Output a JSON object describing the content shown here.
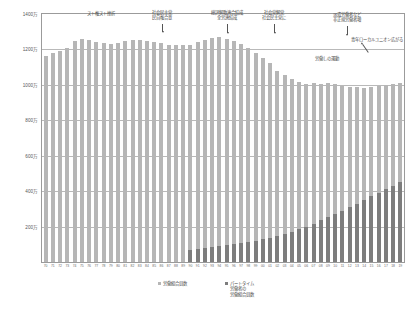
{
  "chart_data": {
    "type": "bar",
    "stacked": true,
    "title": "",
    "subtitle": "",
    "xlabel": "",
    "ylabel": "",
    "ylim": [
      0,
      14000000
    ],
    "y_ticks": [
      0,
      2000000,
      4000000,
      6000000,
      8000000,
      10000000,
      12000000,
      14000000
    ],
    "y_tick_labels": [
      "",
      "200万",
      "400万",
      "600万",
      "800万",
      "1000万",
      "1200万",
      "1400万"
    ],
    "grid": true,
    "legend_position": "bottom",
    "categories": [
      "70",
      "71",
      "72",
      "73",
      "74",
      "75",
      "76",
      "77",
      "78",
      "79",
      "80",
      "81",
      "82",
      "83",
      "84",
      "85",
      "86",
      "87",
      "88",
      "89",
      "90",
      "91",
      "92",
      "93",
      "94",
      "95",
      "96",
      "97",
      "98",
      "99",
      "00",
      "01",
      "02",
      "03",
      "04",
      "05",
      "06",
      "07",
      "08",
      "09",
      "10",
      "11",
      "12",
      "13",
      "14",
      "15",
      "16",
      "17",
      "18",
      "19"
    ],
    "series": [
      {
        "name": "労働組合員数",
        "color": "#b6b6b6",
        "values": [
          11605000,
          11798000,
          11889000,
          12098000,
          12462000,
          12590000,
          12509000,
          12437000,
          12383000,
          12309000,
          12369000,
          12471000,
          12526000,
          12520000,
          12464000,
          12418000,
          12343000,
          12272000,
          12227000,
          12227000,
          12265000,
          12397000,
          12541000,
          12663000,
          12699000,
          12614000,
          12451000,
          12285000,
          12093000,
          11825000,
          11539000,
          11212000,
          10801000,
          10531000,
          10309000,
          10138000,
          10041000,
          10080000,
          10065000,
          10078000,
          10054000,
          9961000,
          9892000,
          9875000,
          9849000,
          9882000,
          9940000,
          9981000,
          10070000,
          10088000
        ]
      },
      {
        "name": "パートタイム労働者の労働組合員数",
        "color": "#7d7d7d",
        "values": [
          0,
          0,
          0,
          0,
          0,
          0,
          0,
          0,
          0,
          0,
          0,
          0,
          0,
          0,
          0,
          0,
          0,
          0,
          0,
          0,
          700000,
          740000,
          780000,
          830000,
          880000,
          940000,
          1000000,
          1060000,
          1130000,
          1200000,
          1280000,
          1370000,
          1470000,
          1580000,
          1700000,
          1850000,
          2000000,
          2160000,
          2350000,
          2530000,
          2700000,
          2900000,
          3100000,
          3300000,
          3500000,
          3700000,
          3900000,
          4100000,
          4300000,
          4500000
        ]
      }
    ],
    "annotations": [
      {
        "id": "annot-strike-right",
        "lines": [
          "スト権スト挫折"
        ],
        "left_pct": 16.5,
        "top_px": 11,
        "pointer": null
      },
      {
        "id": "annot-shakai-minshu",
        "lines": [
          "社会民主党",
          "民自権合意"
        ],
        "left_pct": 33.5,
        "top_px": 10,
        "pointer": {
          "x_pct": 33.5,
          "top_px": 24,
          "height_px": 8,
          "type": "vertical"
        }
      },
      {
        "id": "annot-sohyo-rengo",
        "lines": [
          "総評解散連合結成",
          "全労連結成"
        ],
        "left_pct": 51.5,
        "top_px": 10,
        "pointer": {
          "x_pct": 51.5,
          "top_px": 24,
          "height_px": 9,
          "type": "vertical"
        }
      },
      {
        "id": "annot-shakaito-kaito",
        "lines": [
          "社会党解党",
          "社会民主党に"
        ],
        "left_pct": 64.5,
        "top_px": 10,
        "pointer": {
          "x_pct": 64.5,
          "top_px": 24,
          "height_px": 9,
          "type": "vertical"
        }
      },
      {
        "id": "annot-haken-rodosha",
        "lines": [
          "派遣労働者など",
          "非正規労働者増"
        ],
        "left_pct": 84.5,
        "top_px": 12,
        "pointer": {
          "x_pct": 84.5,
          "top_px": 26,
          "height_px": 9,
          "type": "vertical"
        }
      },
      {
        "id": "annot-rodosha-ha",
        "lines": [
          "労働しの運動"
        ],
        "left_pct": 79.0,
        "top_px": 56,
        "pointer": null
      },
      {
        "id": "annot-local-union",
        "lines": [
          "青年ローカルユニオン広がる"
        ],
        "left_pct": 100.0,
        "top_px": 37,
        "pointer": {
          "x_pct": 89.0,
          "top_px": 44,
          "height_px": 8,
          "type": "diagonal"
        }
      }
    ],
    "legend": [
      {
        "label_lines": [
          "労働組合員数"
        ],
        "color": "#b6b6b6",
        "marker": "square"
      },
      {
        "label_lines": [
          "パートタイム",
          "労働者の",
          "労働組合員数"
        ],
        "color": "#7d7d7d",
        "marker": "square"
      }
    ]
  }
}
